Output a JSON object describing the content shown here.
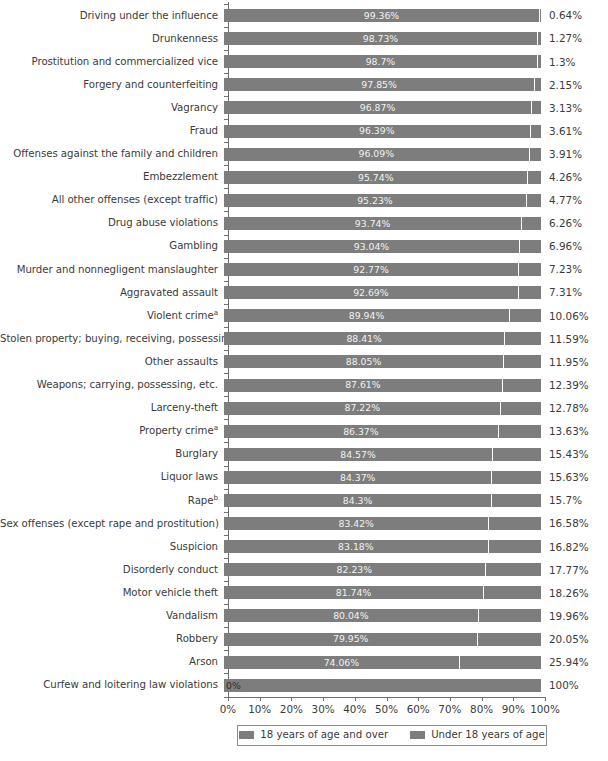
{
  "chart_data": {
    "type": "bar",
    "subtype": "stacked-horizontal-100pct",
    "title": "",
    "xlabel": "",
    "ylabel": "",
    "xlim": [
      0,
      100
    ],
    "xticks": [
      "0%",
      "10%",
      "20%",
      "30%",
      "40%",
      "50%",
      "60%",
      "70%",
      "80%",
      "90%",
      "100%"
    ],
    "grid": false,
    "legend_position": "bottom",
    "series": [
      {
        "name": "18 years of age and over",
        "color": "#7d7d7d"
      },
      {
        "name": "Under 18 years of age",
        "color": "#7d7d7d"
      }
    ],
    "categories": [
      "Driving under the influence",
      "Drunkenness",
      "Prostitution and commercialized vice",
      "Forgery and counterfeiting",
      "Vagrancy",
      "Fraud",
      "Offenses against the family and children",
      "Embezzlement",
      "All other offenses (except traffic)",
      "Drug abuse violations",
      "Gambling",
      "Murder and nonnegligent manslaughter",
      "Aggravated assault",
      "Violent crime",
      "Stolen property; buying, receiving, possessing",
      "Other assaults",
      "Weapons; carrying, possessing, etc.",
      "Larceny-theft",
      "Property crime",
      "Burglary",
      "Liquor laws",
      "Rape",
      "Sex offenses (except rape and prostitution)",
      "Suspicion",
      "Disorderly conduct",
      "Motor vehicle theft",
      "Vandalism",
      "Robbery",
      "Arson",
      "Curfew and loitering law violations"
    ],
    "rows": [
      {
        "category": "Driving under the influence",
        "footnote": "",
        "over18": 99.36,
        "under18": 0.64,
        "over18_label": "99.36%",
        "under18_label": "0.64%"
      },
      {
        "category": "Drunkenness",
        "footnote": "",
        "over18": 98.73,
        "under18": 1.27,
        "over18_label": "98.73%",
        "under18_label": "1.27%"
      },
      {
        "category": "Prostitution and commercialized vice",
        "footnote": "",
        "over18": 98.7,
        "under18": 1.3,
        "over18_label": "98.7%",
        "under18_label": "1.3%"
      },
      {
        "category": "Forgery and counterfeiting",
        "footnote": "",
        "over18": 97.85,
        "under18": 2.15,
        "over18_label": "97.85%",
        "under18_label": "2.15%"
      },
      {
        "category": "Vagrancy",
        "footnote": "",
        "over18": 96.87,
        "under18": 3.13,
        "over18_label": "96.87%",
        "under18_label": "3.13%"
      },
      {
        "category": "Fraud",
        "footnote": "",
        "over18": 96.39,
        "under18": 3.61,
        "over18_label": "96.39%",
        "under18_label": "3.61%"
      },
      {
        "category": "Offenses against the family and children",
        "footnote": "",
        "over18": 96.09,
        "under18": 3.91,
        "over18_label": "96.09%",
        "under18_label": "3.91%"
      },
      {
        "category": "Embezzlement",
        "footnote": "",
        "over18": 95.74,
        "under18": 4.26,
        "over18_label": "95.74%",
        "under18_label": "4.26%"
      },
      {
        "category": "All other offenses (except traffic)",
        "footnote": "",
        "over18": 95.23,
        "under18": 4.77,
        "over18_label": "95.23%",
        "under18_label": "4.77%"
      },
      {
        "category": "Drug abuse violations",
        "footnote": "",
        "over18": 93.74,
        "under18": 6.26,
        "over18_label": "93.74%",
        "under18_label": "6.26%"
      },
      {
        "category": "Gambling",
        "footnote": "",
        "over18": 93.04,
        "under18": 6.96,
        "over18_label": "93.04%",
        "under18_label": "6.96%"
      },
      {
        "category": "Murder and nonnegligent manslaughter",
        "footnote": "",
        "over18": 92.77,
        "under18": 7.23,
        "over18_label": "92.77%",
        "under18_label": "7.23%"
      },
      {
        "category": "Aggravated assault",
        "footnote": "",
        "over18": 92.69,
        "under18": 7.31,
        "over18_label": "92.69%",
        "under18_label": "7.31%"
      },
      {
        "category": "Violent crime",
        "footnote": "a",
        "over18": 89.94,
        "under18": 10.06,
        "over18_label": "89.94%",
        "under18_label": "10.06%"
      },
      {
        "category": "Stolen property; buying, receiving, possessing",
        "footnote": "",
        "over18": 88.41,
        "under18": 11.59,
        "over18_label": "88.41%",
        "under18_label": "11.59%"
      },
      {
        "category": "Other assaults",
        "footnote": "",
        "over18": 88.05,
        "under18": 11.95,
        "over18_label": "88.05%",
        "under18_label": "11.95%"
      },
      {
        "category": "Weapons; carrying, possessing, etc.",
        "footnote": "",
        "over18": 87.61,
        "under18": 12.39,
        "over18_label": "87.61%",
        "under18_label": "12.39%"
      },
      {
        "category": "Larceny-theft",
        "footnote": "",
        "over18": 87.22,
        "under18": 12.78,
        "over18_label": "87.22%",
        "under18_label": "12.78%"
      },
      {
        "category": "Property crime",
        "footnote": "a",
        "over18": 86.37,
        "under18": 13.63,
        "over18_label": "86.37%",
        "under18_label": "13.63%"
      },
      {
        "category": "Burglary",
        "footnote": "",
        "over18": 84.57,
        "under18": 15.43,
        "over18_label": "84.57%",
        "under18_label": "15.43%"
      },
      {
        "category": "Liquor laws",
        "footnote": "",
        "over18": 84.37,
        "under18": 15.63,
        "over18_label": "84.37%",
        "under18_label": "15.63%"
      },
      {
        "category": "Rape",
        "footnote": "b",
        "over18": 84.3,
        "under18": 15.7,
        "over18_label": "84.3%",
        "under18_label": "15.7%"
      },
      {
        "category": "Sex offenses (except rape and prostitution)",
        "footnote": "",
        "over18": 83.42,
        "under18": 16.58,
        "over18_label": "83.42%",
        "under18_label": "16.58%"
      },
      {
        "category": "Suspicion",
        "footnote": "",
        "over18": 83.18,
        "under18": 16.82,
        "over18_label": "83.18%",
        "under18_label": "16.82%"
      },
      {
        "category": "Disorderly conduct",
        "footnote": "",
        "over18": 82.23,
        "under18": 17.77,
        "over18_label": "82.23%",
        "under18_label": "17.77%"
      },
      {
        "category": "Motor vehicle theft",
        "footnote": "",
        "over18": 81.74,
        "under18": 18.26,
        "over18_label": "81.74%",
        "under18_label": "18.26%"
      },
      {
        "category": "Vandalism",
        "footnote": "",
        "over18": 80.04,
        "under18": 19.96,
        "over18_label": "80.04%",
        "under18_label": "19.96%"
      },
      {
        "category": "Robbery",
        "footnote": "",
        "over18": 79.95,
        "under18": 20.05,
        "over18_label": "79.95%",
        "under18_label": "20.05%"
      },
      {
        "category": "Arson",
        "footnote": "",
        "over18": 74.06,
        "under18": 25.94,
        "over18_label": "74.06%",
        "under18_label": "25.94%"
      },
      {
        "category": "Curfew and loitering law violations",
        "footnote": "",
        "over18": 0,
        "under18": 100,
        "over18_label": "0%",
        "under18_label": "100%"
      }
    ]
  },
  "legend": {
    "items": [
      {
        "label": "18 years of age and over",
        "color": "#7d7d7d"
      },
      {
        "label": "Under 18 years of age",
        "color": "#7d7d7d"
      }
    ]
  },
  "axis": {
    "xticks": [
      "0%",
      "10%",
      "20%",
      "30%",
      "40%",
      "50%",
      "60%",
      "70%",
      "80%",
      "90%",
      "100%"
    ]
  }
}
